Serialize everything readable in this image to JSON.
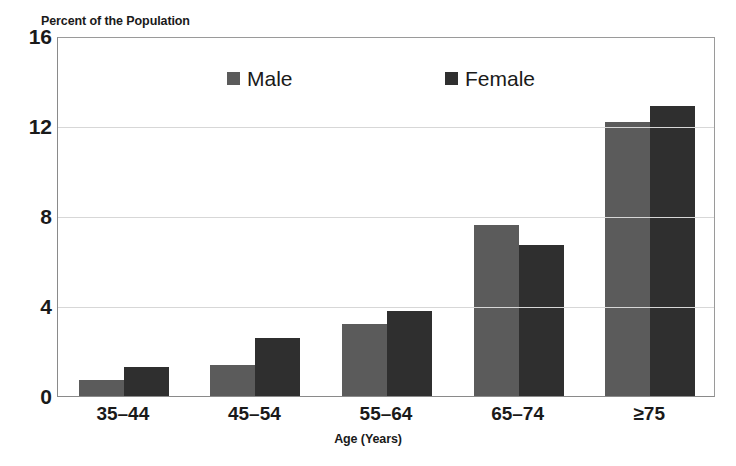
{
  "chart_data": {
    "type": "bar",
    "title": "Percent of the Population",
    "xlabel": "Age (Years)",
    "ylabel": "",
    "categories": [
      "35–44",
      "45–54",
      "55–64",
      "65–74",
      "≥75"
    ],
    "series": [
      {
        "name": "Male",
        "color": "#5b5b5b",
        "values": [
          0.7,
          1.4,
          3.2,
          7.6,
          12.2
        ]
      },
      {
        "name": "Female",
        "color": "#2f2f2f",
        "values": [
          1.3,
          2.6,
          3.8,
          6.7,
          12.9
        ]
      }
    ],
    "ylim": [
      0,
      16
    ],
    "yticks": [
      0,
      4,
      8,
      12,
      16
    ],
    "ytick_labels": [
      "0",
      "4",
      "8",
      "12",
      "16"
    ],
    "grid": true,
    "legend_position": "top-center"
  },
  "legend": {
    "items": [
      {
        "label": "Male",
        "swatch": "male-legend-swatch"
      },
      {
        "label": "Female",
        "swatch": "female-legend-swatch"
      }
    ]
  }
}
